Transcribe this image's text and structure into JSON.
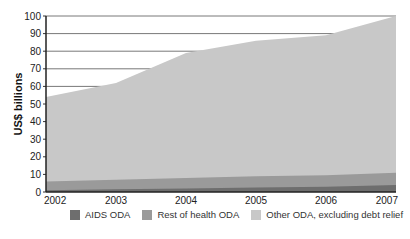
{
  "chart_data": {
    "type": "area",
    "stacked": true,
    "title": "",
    "xlabel": "",
    "ylabel": "US$ billions",
    "x": [
      "2002",
      "2003",
      "2004",
      "2005",
      "2006",
      "2007"
    ],
    "ylim": [
      0,
      100
    ],
    "yticks": [
      0,
      10,
      20,
      30,
      40,
      50,
      60,
      70,
      80,
      90,
      100
    ],
    "grid": true,
    "legend_position": "bottom",
    "series": [
      {
        "name": "AIDS ODA",
        "color": "#6e6e6e",
        "values": [
          1,
          1.5,
          2,
          2.5,
          3,
          4
        ]
      },
      {
        "name": "Rest of health ODA",
        "color": "#9a9a9a",
        "values": [
          5,
          5.5,
          6,
          6.5,
          6.5,
          7
        ]
      },
      {
        "name": "Other ODA, excluding debt relief",
        "color": "#c8c8c8",
        "values": [
          48,
          55,
          71,
          77,
          79.5,
          89
        ]
      }
    ],
    "totals": [
      54,
      62,
      79,
      86,
      89,
      100
    ]
  },
  "legend": {
    "items": [
      {
        "label": "AIDS ODA",
        "color": "#6e6e6e"
      },
      {
        "label": "Rest of health ODA",
        "color": "#9a9a9a"
      },
      {
        "label": "Other ODA, excluding debt relief",
        "color": "#c8c8c8"
      }
    ]
  }
}
